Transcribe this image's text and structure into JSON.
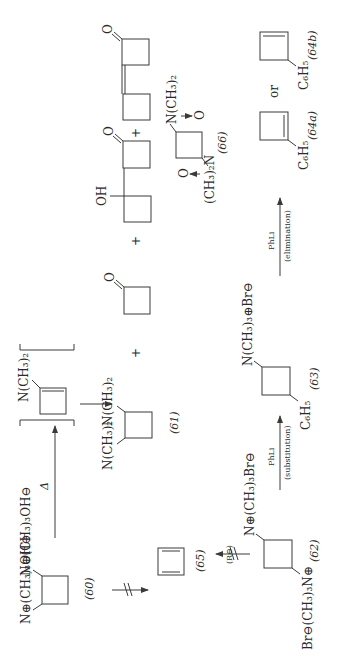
{
  "scheme": {
    "compounds": {
      "c60": {
        "label": "(60)",
        "sub1": "N⊕(CH₃)₃OH⊖",
        "sub2": "N⊕(CH₃)₃OH⊖"
      },
      "c65": {
        "label": "(65)"
      },
      "c62": {
        "label": "(62)",
        "sub1": "N⊕(CH₃)₃Br⊖",
        "sub2": "Br⊖(CH₃)₃N⊕"
      },
      "intermediate": {
        "sub": "N(CH₃)₂"
      },
      "c61": {
        "label": "(61)",
        "sub1": "N(CH₃)₂",
        "sub2": "N(CH₃)₂"
      },
      "cyclobutanone": {
        "sub": "O"
      },
      "dimer_alcohol": {
        "oh": "OH",
        "o": "O"
      },
      "dimer_enone": {
        "o": "O"
      },
      "c66": {
        "label": "(66)",
        "sub1": "N(CH₃)₂",
        "sub1_oxide": "O",
        "sub2": "(CH₃)₂N",
        "sub2_oxide": "O"
      },
      "c63": {
        "label": "(63)",
        "sub1": "N(CH₃)₃⊕Br⊖",
        "sub2": "C₆H₅"
      },
      "c64a": {
        "label": "(64a)",
        "sub": "C₆H₅"
      },
      "c64b": {
        "label": "(64b)",
        "sub": "C₆H₅"
      }
    },
    "arrows": {
      "heat": {
        "label": "Δ"
      },
      "r_minus": {
        "label": "(R⊖)"
      },
      "substitution": {
        "reagent": "PhLi",
        "condition": "(substitution)"
      },
      "elimination": {
        "reagent": "PhLi",
        "condition": "(elimination)"
      }
    },
    "operators": {
      "plus": "+",
      "or": "or"
    }
  }
}
